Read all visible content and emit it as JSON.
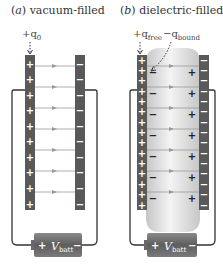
{
  "panels": [
    {
      "title": "(a) vacuum-filled",
      "title_letter": "a",
      "title_text": "vacuum-filled",
      "charge_label": "+q",
      "charge_sub": "0",
      "plate_left_charges": [
        "+",
        "+",
        "+",
        "+",
        "+",
        "+",
        "+",
        "+",
        "+",
        "+"
      ],
      "plate_right_charges": [
        "−",
        "−",
        "−",
        "−",
        "−",
        "−",
        "−",
        "−",
        "−",
        "−"
      ],
      "field_lines": 7,
      "battery_label": "V",
      "battery_sub": "batt",
      "battery_pos": "+",
      "battery_neg": "−"
    },
    {
      "title": "(b) dielectric-filled",
      "title_letter": "b",
      "title_text": "dielectric-filled",
      "charge_label_free": "+q",
      "charge_sub_free": "free",
      "charge_label_bound": "−q",
      "charge_sub_bound": "bound",
      "plate_left_charges": [
        "+",
        "+",
        "+",
        "+",
        "+",
        "+",
        "+",
        "+",
        "+",
        "+",
        "+",
        "+",
        "+",
        "+",
        "+"
      ],
      "plate_right_charges": [
        "−",
        "−",
        "−",
        "−",
        "−",
        "−",
        "−",
        "−",
        "−",
        "−",
        "−",
        "−",
        "−",
        "−",
        "−"
      ],
      "dielectric_left_charges": [
        "−",
        "−",
        "−",
        "−",
        "−",
        "−",
        "−"
      ],
      "dielectric_right_charges": [
        "+",
        "+",
        "+",
        "+",
        "+",
        "+",
        "+"
      ],
      "field_lines": 7,
      "battery_label": "V",
      "battery_sub": "batt",
      "battery_pos": "+",
      "battery_neg": "−"
    }
  ],
  "colors": {
    "plate": "#595959",
    "wire": "#333333",
    "field_line": "#9a9a9a",
    "dielectric_light": "#f2f2f2",
    "dielectric_dark": "#c9c9c9",
    "battery": "#6a6a6a"
  }
}
